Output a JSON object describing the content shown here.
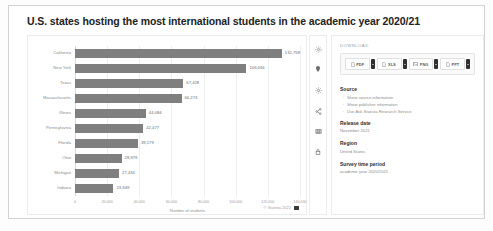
{
  "page": {
    "title": "U.S. states hosting the most international students in the academic year 2020/21"
  },
  "chart_data": {
    "type": "bar",
    "orientation": "horizontal",
    "title": "U.S. states hosting the most international students in the academic year 2020/21",
    "categories": [
      "California",
      "New York",
      "Texas",
      "Massachusetts",
      "Illinois",
      "Pennsylvania",
      "Florida",
      "Ohio",
      "Michigan",
      "Indiana"
    ],
    "values": [
      132758,
      106694,
      67428,
      66273,
      44084,
      42477,
      39179,
      28979,
      27434,
      23949
    ],
    "value_labels": [
      "132,758",
      "106,694",
      "67,428",
      "66,273",
      "44,084",
      "42,477",
      "39,179",
      "28,979",
      "27,434",
      "23,949"
    ],
    "xlabel": "Number of students",
    "ylabel": "",
    "xlim": [
      0,
      140000
    ],
    "xticks": [
      0,
      20000,
      40000,
      60000,
      80000,
      100000,
      120000,
      140000
    ],
    "xtick_labels": [
      "0",
      "20,000",
      "40,000",
      "60,000",
      "80,000",
      "100,000",
      "120,000",
      "140,000"
    ],
    "grid": true,
    "legend": false,
    "bar_color": "#7f7f7f"
  },
  "chart_footer": {
    "copyright": "© Statista 2022"
  },
  "icon_rail": [
    {
      "name": "settings-icon",
      "label": "Settings"
    },
    {
      "name": "pin-icon",
      "label": "Pin"
    },
    {
      "name": "gear-icon",
      "label": "Options"
    },
    {
      "name": "share-icon",
      "label": "Share"
    },
    {
      "name": "table-icon",
      "label": "Show table"
    },
    {
      "name": "lock-icon",
      "label": "Lock"
    }
  ],
  "download": {
    "caption": "DOWNLOAD",
    "buttons": [
      {
        "label": "PDF",
        "icon": "pdf-file-icon"
      },
      {
        "label": "XLS",
        "icon": "xls-file-icon"
      },
      {
        "label": "PNG",
        "icon": "png-image-icon"
      },
      {
        "label": "PPT",
        "icon": "ppt-file-icon"
      }
    ]
  },
  "source": {
    "heading": "Source",
    "links": [
      "Show source information",
      "Show publisher information",
      "Use Ask Statista Research Service"
    ]
  },
  "meta": [
    {
      "heading": "Release date",
      "value": "November 2021"
    },
    {
      "heading": "Region",
      "value": "United States"
    },
    {
      "heading": "Survey time period",
      "value": "academic year 2020/2021"
    }
  ],
  "colors": {
    "bar": "#7f7f7f",
    "border": "#ececec",
    "text": "#2e2e2e",
    "muted": "#8d8d8d"
  }
}
